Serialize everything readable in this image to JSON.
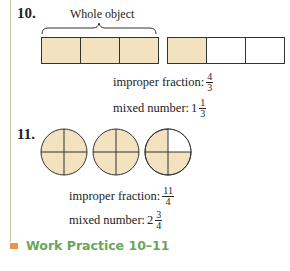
{
  "problem10": {
    "number": "10.",
    "brace_label": "Whole object",
    "bar1_cells": [
      "fill",
      "fill",
      "fill"
    ],
    "bar2_cells": [
      "fill",
      "empty",
      "empty"
    ],
    "improper_label": "improper fraction:",
    "improper_num": "4",
    "improper_den": "3",
    "mixed_label": "mixed number:",
    "mixed_whole": "1",
    "mixed_num": "1",
    "mixed_den": "3"
  },
  "problem11": {
    "number": "11.",
    "circles": [
      4,
      4,
      3
    ],
    "improper_label": "improper fraction:",
    "improper_num": "11",
    "improper_den": "4",
    "mixed_label": "mixed number:",
    "mixed_whole": "2",
    "mixed_num": "3",
    "mixed_den": "4"
  },
  "footer": {
    "title": "Work Practice 10–11"
  },
  "colors": {
    "fill": "#f2e2c0",
    "accent_square": "#e8954a",
    "footer_text": "#6aa55c"
  }
}
